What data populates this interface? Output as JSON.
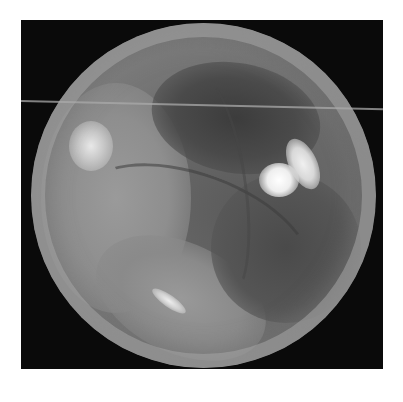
{
  "image": {
    "description": "Grayscale otoscopic (endoscopic) view of a tympanic membrane within a circular field on a black square background",
    "colors": {
      "page_background": "#ffffff",
      "frame_background": "#0a0a0a",
      "tissue_mid": "#7d7d7d",
      "tissue_dark": "#3c3c3c",
      "highlight": "#ffffff"
    }
  }
}
